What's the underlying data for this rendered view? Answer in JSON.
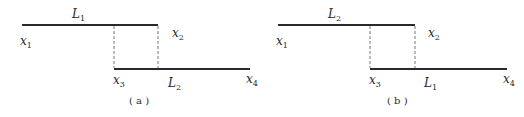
{
  "panels": [
    {
      "id": "a",
      "caption": "( a )",
      "top_segment_label": "L",
      "top_segment_sub": "1",
      "bottom_segment_label": "L",
      "bottom_segment_sub": "2",
      "points": [
        {
          "name": "x",
          "sub": "1"
        },
        {
          "name": "x",
          "sub": "2"
        },
        {
          "name": "x",
          "sub": "3"
        },
        {
          "name": "x",
          "sub": "4"
        }
      ]
    },
    {
      "id": "b",
      "caption": "( b )",
      "top_segment_label": "L",
      "top_segment_sub": "2",
      "bottom_segment_label": "L",
      "bottom_segment_sub": "1",
      "points": [
        {
          "name": "x",
          "sub": "1"
        },
        {
          "name": "x",
          "sub": "2"
        },
        {
          "name": "x",
          "sub": "3"
        },
        {
          "name": "x",
          "sub": "4"
        }
      ]
    }
  ]
}
